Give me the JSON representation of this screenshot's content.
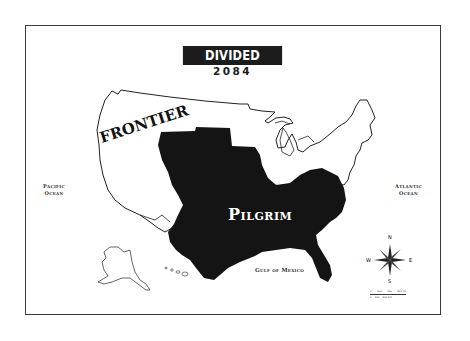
{
  "title": "DIVIDED STATES",
  "subtitle": "2084",
  "regions": [
    {
      "name": "FRONTIER",
      "fill": "#ffffff",
      "stroke": "#222222"
    },
    {
      "name": "Pilgrim",
      "fill": "#141414",
      "text_color": "#ffffff"
    }
  ],
  "water_labels": {
    "pacific": [
      "Pacific",
      "Ocean"
    ],
    "atlantic": [
      "Atlantic",
      "Ocean"
    ],
    "gulf": "Gulf of Mexico"
  },
  "compass": {
    "n": "N",
    "s": "S",
    "e": "E",
    "w": "W"
  },
  "scale_bar": {
    "top": [
      "0",
      "100",
      "200",
      "300 mi"
    ],
    "bottom": [
      "0",
      "200",
      "400 km"
    ]
  },
  "colors": {
    "frame": "#3a3a3a",
    "banner_bg": "#1c1c1c",
    "land_outline": "#222222",
    "pilgrim_fill": "#141414"
  }
}
